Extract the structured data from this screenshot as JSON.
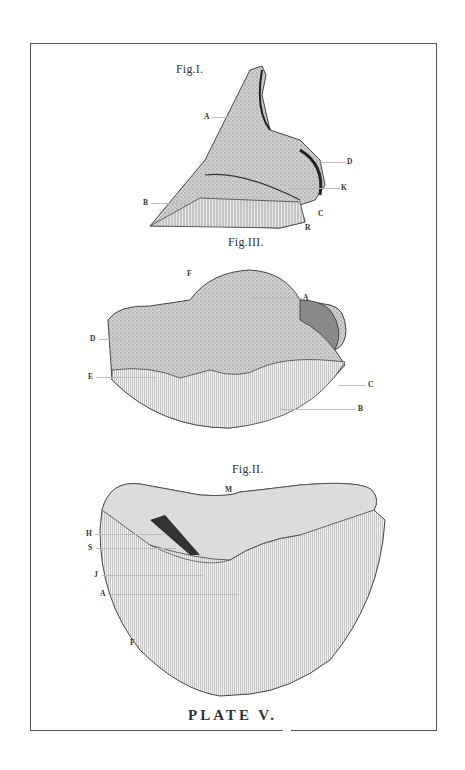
{
  "plate": {
    "caption": "PLATE V.",
    "frame_color": "#555555",
    "ink_color": "#333333"
  },
  "figures": [
    {
      "id": "fig1",
      "title": "Fig.I.",
      "labels": [
        "A",
        "B",
        "C",
        "D",
        "K",
        "R"
      ]
    },
    {
      "id": "fig3",
      "title": "Fig.III.",
      "labels": [
        "F",
        "A",
        "D",
        "E",
        "C",
        "B"
      ]
    },
    {
      "id": "fig2",
      "title": "Fig.II.",
      "labels": [
        "M",
        "H",
        "S",
        "J",
        "A",
        "F"
      ]
    }
  ]
}
